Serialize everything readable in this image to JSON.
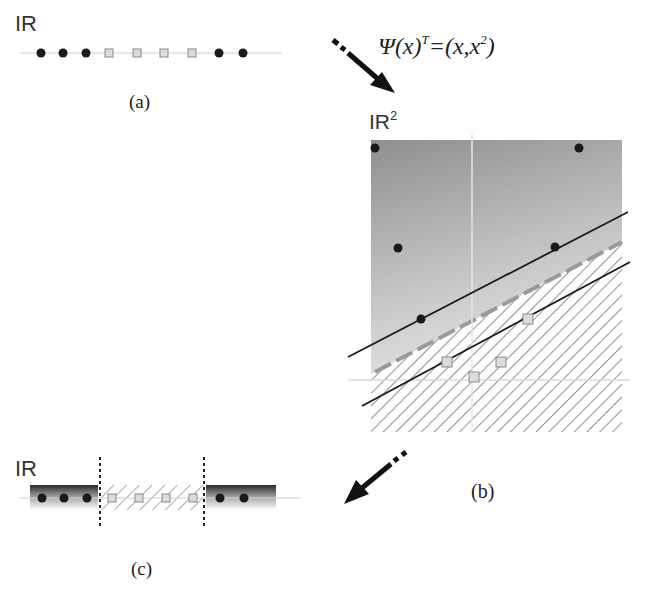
{
  "panels": {
    "a": {
      "caption": "(a)",
      "space_label": "IR",
      "axis": {
        "x1": 20,
        "x2": 282,
        "y": 53
      },
      "points": [
        {
          "type": "dot",
          "x": 41
        },
        {
          "type": "dot",
          "x": 63
        },
        {
          "type": "dot",
          "x": 86
        },
        {
          "type": "square",
          "x": 109
        },
        {
          "type": "square",
          "x": 137
        },
        {
          "type": "square",
          "x": 164
        },
        {
          "type": "square",
          "x": 192
        },
        {
          "type": "dot",
          "x": 219
        },
        {
          "type": "dot",
          "x": 243
        }
      ]
    },
    "b": {
      "caption": "(b)",
      "space_label": "IR",
      "space_superscript": "2",
      "mapping_formula": {
        "psi": "Ψ(x)",
        "transpose": "T",
        "rhs": "=(x,x",
        "rhs_sup": "2",
        "rhs_close": ")"
      },
      "plot_box": {
        "x": 371,
        "y": 140,
        "w": 251,
        "h": 292
      },
      "axes": {
        "vertical_x": 472,
        "horizontal_y": 380
      },
      "dots": [
        {
          "x": 375,
          "y": 148
        },
        {
          "x": 579,
          "y": 148
        },
        {
          "x": 398,
          "y": 248
        },
        {
          "x": 555,
          "y": 247
        },
        {
          "x": 421,
          "y": 319
        }
      ],
      "squares": [
        {
          "x": 528,
          "y": 319
        },
        {
          "x": 447,
          "y": 362
        },
        {
          "x": 474,
          "y": 377
        },
        {
          "x": 501,
          "y": 362
        }
      ],
      "upper_margin_line": {
        "x1": 348,
        "y1": 357,
        "x2": 628,
        "y2": 212
      },
      "lower_margin_line": {
        "x1": 362,
        "y1": 406,
        "x2": 630,
        "y2": 262
      },
      "decision_boundary": {
        "x1": 375,
        "y1": 372,
        "x2": 622,
        "y2": 242
      }
    },
    "c": {
      "caption": "(c)",
      "space_label": "IR",
      "axis": {
        "x1": 20,
        "x2": 300,
        "y": 498
      },
      "thresholds": [
        100,
        204
      ],
      "points": [
        {
          "type": "dot",
          "x": 42
        },
        {
          "type": "dot",
          "x": 64
        },
        {
          "type": "dot",
          "x": 87
        },
        {
          "type": "square",
          "x": 112
        },
        {
          "type": "square",
          "x": 139
        },
        {
          "type": "square",
          "x": 166
        },
        {
          "type": "square",
          "x": 193
        },
        {
          "type": "dot",
          "x": 220
        },
        {
          "type": "dot",
          "x": 244
        }
      ]
    }
  },
  "arrows": [
    {
      "name": "map-to-feature-space",
      "x1": 333,
      "y1": 40,
      "x2": 395,
      "y2": 93
    },
    {
      "name": "map-back-to-input-space",
      "x1": 406,
      "y1": 452,
      "x2": 344,
      "y2": 504
    }
  ],
  "colors": {
    "dot": "#1a1a1a",
    "square_fill": "#dcdcdc",
    "square_stroke": "#8a8a8a",
    "axis": "#d0d0d0",
    "line": "#1a1a1a",
    "hatch": "#555555",
    "boundary": "#9a9a9a"
  }
}
